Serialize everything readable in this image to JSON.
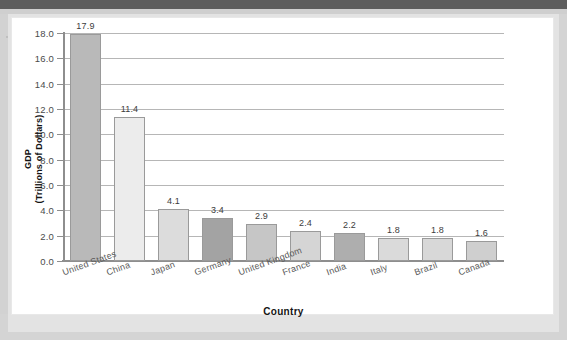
{
  "chart_data": {
    "type": "bar",
    "title": "",
    "xlabel": "Country",
    "ylabel_line1": "GDP",
    "ylabel_line2": "(Trillions of Dollars)",
    "categories": [
      "United States",
      "China",
      "Japan",
      "Germany",
      "United Kingdom",
      "France",
      "India",
      "Italy",
      "Brazil",
      "Canada"
    ],
    "values": [
      17.9,
      11.4,
      4.1,
      3.4,
      2.9,
      2.4,
      2.2,
      1.8,
      1.8,
      1.6
    ],
    "value_labels": [
      "17.9",
      "11.4",
      "4.1",
      "3.4",
      "2.9",
      "2.4",
      "2.2",
      "1.8",
      "1.8",
      "1.6"
    ],
    "bar_colors": [
      "#b9b9b9",
      "#ececec",
      "#dcdcdc",
      "#a3a3a3",
      "#c6c6c6",
      "#d5d5d5",
      "#aeaeae",
      "#dadada",
      "#d8d8d8",
      "#cfcfcf"
    ],
    "ylim": [
      0.0,
      18.0
    ],
    "ytick_labels": [
      "0.0",
      "2.0",
      "4.0",
      "6.0",
      "8.0",
      "10.0",
      "12.0",
      "14.0",
      "16.0",
      "18.0"
    ],
    "ytick_values": [
      0.0,
      2.0,
      4.0,
      6.0,
      8.0,
      10.0,
      12.0,
      14.0,
      16.0,
      18.0
    ],
    "grid": true,
    "grid_axis": "y",
    "legend": false,
    "legend_position": "none",
    "axis_color": "#8e8e8e",
    "grid_color": "#b6b6b6",
    "bar_border_color": "#9a9a9a"
  }
}
